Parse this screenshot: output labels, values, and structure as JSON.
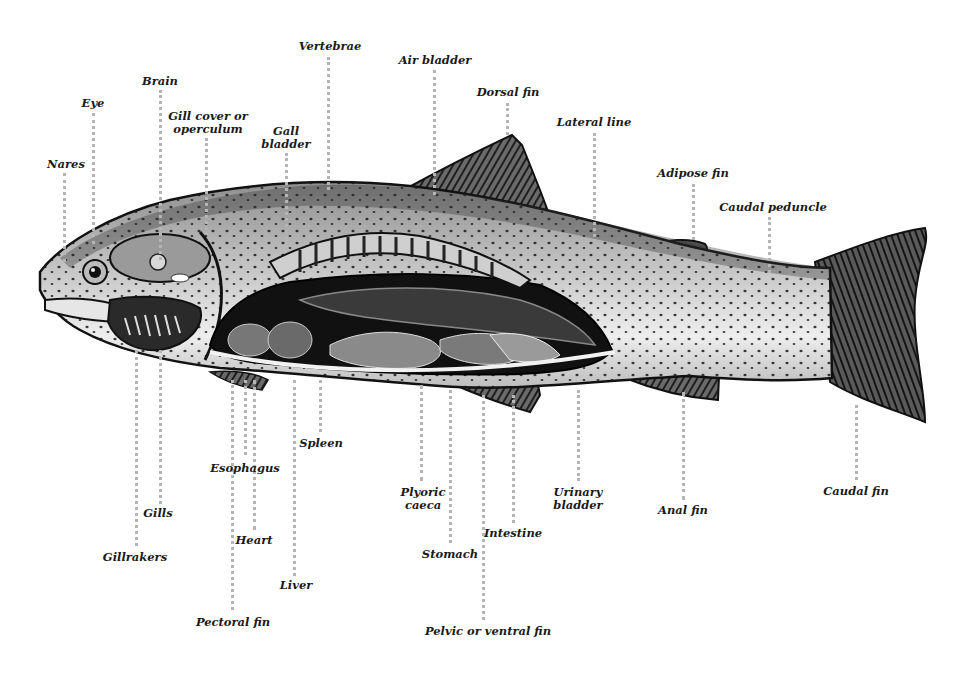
{
  "diagram": {
    "leader_color": "#b5b5b5",
    "label_color": "#1a1a1a",
    "labels": [
      {
        "id": "nares",
        "text": "Nares",
        "x": 66,
        "y": 158,
        "line": {
          "x": 64,
          "y1": 173,
          "y2": 262
        }
      },
      {
        "id": "eye",
        "text": "Eye",
        "x": 93,
        "y": 97,
        "line": {
          "x": 93,
          "y1": 113,
          "y2": 244
        }
      },
      {
        "id": "brain",
        "text": "Brain",
        "x": 160,
        "y": 75,
        "line": {
          "x": 160,
          "y1": 90,
          "y2": 260
        }
      },
      {
        "id": "gill-cover",
        "text": "Gill cover or\noperculum",
        "x": 208,
        "y": 110,
        "line": {
          "x": 206,
          "y1": 138,
          "y2": 235
        }
      },
      {
        "id": "gall-bladder",
        "text": "Gall\nbladder",
        "x": 286,
        "y": 125,
        "line": {
          "x": 286,
          "y1": 153,
          "y2": 250
        }
      },
      {
        "id": "vertebrae",
        "text": "Vertebrae",
        "x": 330,
        "y": 40,
        "line": {
          "x": 328,
          "y1": 57,
          "y2": 190
        }
      },
      {
        "id": "air-bladder",
        "text": "Air bladder",
        "x": 435,
        "y": 54,
        "line": {
          "x": 434,
          "y1": 70,
          "y2": 195
        }
      },
      {
        "id": "dorsal-fin",
        "text": "Dorsal fin",
        "x": 508,
        "y": 86,
        "line": {
          "x": 507,
          "y1": 103,
          "y2": 135
        }
      },
      {
        "id": "lateral-line",
        "text": "Lateral line",
        "x": 594,
        "y": 116,
        "line": {
          "x": 594,
          "y1": 133,
          "y2": 237
        }
      },
      {
        "id": "adipose-fin",
        "text": "Adipose fin",
        "x": 693,
        "y": 167,
        "line": {
          "x": 693,
          "y1": 184,
          "y2": 240
        }
      },
      {
        "id": "caudal-peduncle",
        "text": "Caudal peduncle",
        "x": 773,
        "y": 201,
        "line": {
          "x": 769,
          "y1": 217,
          "y2": 273
        }
      },
      {
        "id": "gillrakers",
        "text": "Gillrakers",
        "x": 135,
        "y": 551,
        "line": {
          "x": 136,
          "y1": 350,
          "y2": 546
        }
      },
      {
        "id": "gills",
        "text": "Gills",
        "x": 158,
        "y": 507,
        "line": {
          "x": 160,
          "y1": 350,
          "y2": 504
        }
      },
      {
        "id": "esophagus",
        "text": "Esophagus",
        "x": 245,
        "y": 462,
        "line": {
          "x": 245,
          "y1": 380,
          "y2": 455
        }
      },
      {
        "id": "heart",
        "text": "Heart",
        "x": 254,
        "y": 534,
        "line": {
          "x": 254,
          "y1": 380,
          "y2": 530
        }
      },
      {
        "id": "pectoral-fin",
        "text": "Pectoral fin",
        "x": 233,
        "y": 616,
        "line": {
          "x": 232,
          "y1": 380,
          "y2": 610
        }
      },
      {
        "id": "liver",
        "text": "Liver",
        "x": 296,
        "y": 579,
        "line": {
          "x": 294,
          "y1": 380,
          "y2": 576
        }
      },
      {
        "id": "spleen",
        "text": "Spleen",
        "x": 321,
        "y": 437,
        "line": {
          "x": 320,
          "y1": 380,
          "y2": 432
        }
      },
      {
        "id": "plyoric-caeca",
        "text": "Plyoric\ncaeca",
        "x": 423,
        "y": 486,
        "line": {
          "x": 421,
          "y1": 385,
          "y2": 481
        }
      },
      {
        "id": "stomach",
        "text": "Stomach",
        "x": 450,
        "y": 548,
        "line": {
          "x": 450,
          "y1": 390,
          "y2": 543
        }
      },
      {
        "id": "intestine",
        "text": "Intestine",
        "x": 513,
        "y": 527,
        "line": {
          "x": 513,
          "y1": 395,
          "y2": 523
        }
      },
      {
        "id": "pelvic-fin",
        "text": "Pelvic or ventral fin",
        "x": 488,
        "y": 625,
        "line": {
          "x": 483,
          "y1": 395,
          "y2": 620
        }
      },
      {
        "id": "urinary-bladder",
        "text": "Urinary\nbladder",
        "x": 578,
        "y": 486,
        "line": {
          "x": 578,
          "y1": 390,
          "y2": 481
        }
      },
      {
        "id": "anal-fin",
        "text": "Anal fin",
        "x": 683,
        "y": 504,
        "line": {
          "x": 683,
          "y1": 392,
          "y2": 500
        }
      },
      {
        "id": "caudal-fin",
        "text": "Caudal fin",
        "x": 856,
        "y": 485,
        "line": {
          "x": 856,
          "y1": 405,
          "y2": 480
        }
      }
    ]
  }
}
